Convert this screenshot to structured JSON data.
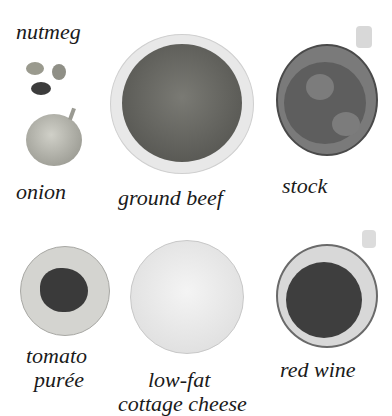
{
  "ingredients": [
    {
      "label": "nutmeg"
    },
    {
      "label": "onion"
    },
    {
      "label": "ground beef"
    },
    {
      "label": "stock"
    },
    {
      "label": "tomato"
    },
    {
      "label": "purée"
    },
    {
      "label": "low-fat"
    },
    {
      "label": "cottage cheese"
    },
    {
      "label": "red wine"
    }
  ]
}
